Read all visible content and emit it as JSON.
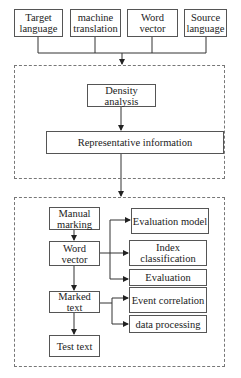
{
  "inputs": [
    {
      "label": "Target language"
    },
    {
      "label": "machine translation"
    },
    {
      "label": "Word vector"
    },
    {
      "label": "Source language"
    }
  ],
  "stage1": {
    "density": "Density analysis",
    "representative": "Representative information"
  },
  "stage2": {
    "left": [
      "Manual marking",
      "Word vector",
      "Marked text",
      "Test text"
    ],
    "right": [
      "Evaluation model",
      "Index classification",
      "Evaluation",
      "Event correlation",
      "data processing"
    ]
  }
}
